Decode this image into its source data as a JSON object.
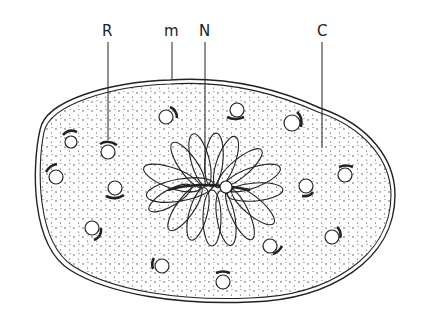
{
  "diagram": {
    "labels": [
      {
        "id": "R",
        "text": "R",
        "x": 107,
        "y": 35,
        "line_to": [
          108,
          140
        ]
      },
      {
        "id": "m",
        "text": "m",
        "x": 172,
        "y": 35,
        "line_to": [
          172,
          78
        ]
      },
      {
        "id": "N",
        "text": "N",
        "x": 204,
        "y": 35,
        "line_to": [
          205,
          173
        ]
      },
      {
        "id": "C",
        "text": "C",
        "x": 323,
        "y": 35,
        "line_to": [
          323,
          148
        ]
      }
    ],
    "colors": {
      "ink": "#222222",
      "background": "#ffffff"
    },
    "organelles": [
      {
        "cx": 71,
        "cy": 142,
        "cap": "upper-left"
      },
      {
        "cx": 108,
        "cy": 150,
        "cap": "top"
      },
      {
        "cx": 58,
        "cy": 176,
        "cap": "upper-left"
      },
      {
        "cx": 166,
        "cy": 119,
        "cap": "upper-right"
      },
      {
        "cx": 237,
        "cy": 109,
        "cap": "bottom"
      },
      {
        "cx": 291,
        "cy": 123,
        "cap": "right"
      },
      {
        "cx": 345,
        "cy": 172,
        "cap": "top"
      },
      {
        "cx": 116,
        "cy": 188,
        "cap": "bottom"
      },
      {
        "cx": 93,
        "cy": 230,
        "cap": "lower-right"
      },
      {
        "cx": 305,
        "cy": 186,
        "cap": "bottom-right"
      },
      {
        "cx": 332,
        "cy": 234,
        "cap": "upper-right"
      },
      {
        "cx": 163,
        "cy": 266,
        "cap": "left"
      },
      {
        "cx": 222,
        "cy": 282,
        "cap": "top"
      },
      {
        "cx": 272,
        "cy": 247,
        "cap": "lower-right"
      },
      {
        "cx": 226,
        "cy": 189,
        "cap": "bottom"
      }
    ]
  }
}
